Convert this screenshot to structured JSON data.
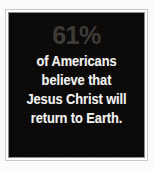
{
  "card": {
    "headline_figure": "61%",
    "statement_lines": [
      "of Americans",
      "believe that",
      "Jesus Christ will",
      "return to Earth."
    ],
    "full_statement": "61% of Americans believe that Jesus Christ will return to Earth.",
    "colors": {
      "page_background": "#fbfbfa",
      "panel_background": "#0a0908",
      "frame_outer_rule": "#c9c9c9",
      "frame_inner_rule": "#8d8d8d",
      "frame_gap": "#ffffff",
      "headline_figure_color": "#3d3b39",
      "statement_text_color": "#f2f2f0"
    }
  }
}
